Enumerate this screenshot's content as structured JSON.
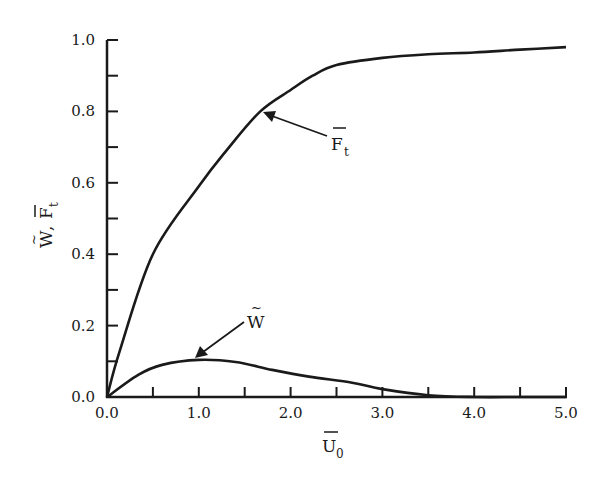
{
  "chart_data": {
    "type": "line",
    "title": "",
    "xlabel": "Ū0",
    "ylabel": "W̃, F̄t",
    "xlim": [
      0.0,
      5.0
    ],
    "ylim": [
      0.0,
      1.0
    ],
    "grid": false,
    "legend": "none (curves labeled with arrows)",
    "x_ticks": [
      "0.0",
      "1.0",
      "2.0",
      "3.0",
      "4.0",
      "5.0"
    ],
    "x_minor_ticks": [
      0.5,
      1.5,
      2.5,
      3.5,
      4.5
    ],
    "y_ticks": [
      "0.0",
      "0.2",
      "0.4",
      "0.6",
      "0.8",
      "1.0"
    ],
    "y_minor_ticks": [
      0.1,
      0.3,
      0.5,
      0.7,
      0.9
    ],
    "series": [
      {
        "name": "F̄t",
        "label_main": "F",
        "label_sub": "t",
        "x": [
          0.0,
          0.14,
          0.5,
          1.0,
          1.3,
          1.67,
          2.0,
          2.24,
          2.5,
          3.0,
          3.5,
          4.0,
          4.5,
          5.0
        ],
        "values": [
          0.0,
          0.13,
          0.4,
          0.59,
          0.69,
          0.8,
          0.86,
          0.9,
          0.93,
          0.95,
          0.96,
          0.965,
          0.973,
          0.98
        ]
      },
      {
        "name": "W̃",
        "label_main": "W",
        "x": [
          0.0,
          0.34,
          0.6,
          1.0,
          1.4,
          1.8,
          2.2,
          2.67,
          3.0,
          3.5,
          4.0,
          4.5,
          5.0
        ],
        "values": [
          0.0,
          0.062,
          0.09,
          0.104,
          0.098,
          0.076,
          0.057,
          0.04,
          0.022,
          0.005,
          0.0,
          0.0,
          0.0
        ]
      }
    ],
    "annotations": [
      {
        "text": "F̄t",
        "arrow_to": [
          1.7,
          0.8
        ]
      },
      {
        "text": "W̃",
        "arrow_to": [
          0.97,
          0.11
        ]
      }
    ]
  },
  "labels": {
    "x_axis_main": "U",
    "x_axis_sub": "0",
    "y_axis_w": "W",
    "y_axis_sep": ", ",
    "y_axis_f": "F",
    "y_axis_f_sub": "t",
    "ft_main": "F",
    "ft_sub": "t",
    "w_main": "W",
    "tilde": "~"
  }
}
